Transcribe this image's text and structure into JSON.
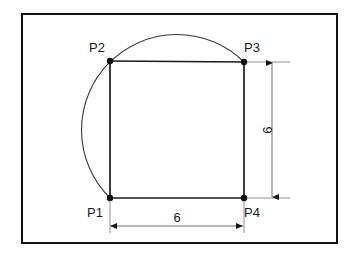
{
  "figure": {
    "frame": {
      "x": 22,
      "y": 14,
      "width": 315,
      "height": 229,
      "stroke_color": "#111111"
    },
    "points": [
      {
        "id": "P1",
        "label": "P1",
        "x": 110,
        "y": 198,
        "label_x": 87,
        "label_y": 217,
        "label_anchor": "start"
      },
      {
        "id": "P2",
        "label": "P2",
        "x": 110,
        "y": 61,
        "label_x": 89,
        "label_y": 52,
        "label_anchor": "start"
      },
      {
        "id": "P3",
        "label": "P3",
        "x": 244,
        "y": 62,
        "label_x": 244,
        "label_y": 52,
        "label_anchor": "start"
      },
      {
        "id": "P4",
        "label": "P4",
        "x": 244,
        "y": 198,
        "label_x": 244,
        "label_y": 217,
        "label_anchor": "start"
      }
    ],
    "vertex_radius": 3.2,
    "square": {
      "edges": [
        {
          "name": "left-edge",
          "x1": 110,
          "y1": 61,
          "x2": 110,
          "y2": 198
        },
        {
          "name": "top-edge",
          "x1": 110,
          "y1": 61,
          "x2": 244,
          "y2": 62
        },
        {
          "name": "right-edge",
          "x1": 244,
          "y1": 62,
          "x2": 244,
          "y2": 198
        },
        {
          "name": "bottom-edge",
          "x1": 110,
          "y1": 198,
          "x2": 244,
          "y2": 198
        }
      ]
    },
    "arc": {
      "description": "circular arc through P1, P2 and P3",
      "path": "M 110 198 A 81 81 0 1 1 244 62",
      "stroke_color": "#3a3a3a",
      "leftmost_x": 84,
      "apex_y": 36
    },
    "dimensions": [
      {
        "name": "width-dimension",
        "value": "6",
        "orientation": "horizontal",
        "line_y": 226,
        "from_x": 110,
        "to_x": 244,
        "label_x": 177,
        "label_y": 222,
        "extension_lines": [
          {
            "x1": 110,
            "y1": 200,
            "x2": 110,
            "y2": 233
          },
          {
            "x1": 244,
            "y1": 200,
            "x2": 244,
            "y2": 233
          }
        ]
      },
      {
        "name": "height-dimension",
        "value": "6",
        "orientation": "vertical",
        "line_x": 272,
        "from_y": 62,
        "to_y": 198,
        "label_x": 272,
        "label_y": 130,
        "label_rotation": -90,
        "extension_lines": [
          {
            "x1": 246,
            "y1": 62,
            "x2": 290,
            "y2": 62
          },
          {
            "x1": 246,
            "y1": 198,
            "x2": 290,
            "y2": 198
          }
        ]
      }
    ],
    "colors": {
      "background": "#ffffff",
      "frame": "#111111",
      "geometry": "#1b1b1b",
      "arc": "#3a3a3a",
      "dimension": "#6d6d6d",
      "text": "#1a1a1a"
    }
  }
}
